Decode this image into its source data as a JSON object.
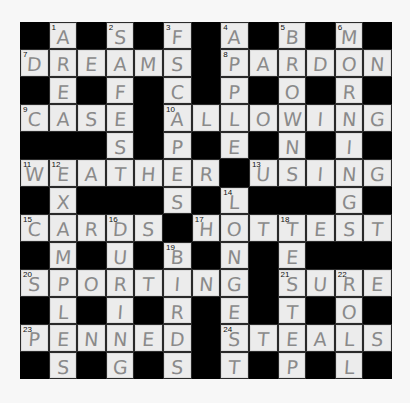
{
  "puzzle": {
    "rows": 13,
    "cols": 13,
    "colors": {
      "background": "#f7f7f7",
      "block": "#000000",
      "cell": "#ececec",
      "pencil": "#8a8a8a",
      "number": "#111111"
    },
    "grid": [
      "#A#S#F#A#B#M#",
      "DREAMS#PARDON",
      "#E#F#C#P#O#R#",
      "CASE#ALLOWING",
      "###S#P#E#N#I#",
      "WEATHER#USING",
      "#X###S#L###G#",
      "CARDS#HOTTEST",
      "#M#U#B#N#E###",
      "SPORTING#SURE",
      "#L#I#R#E#T#O#",
      "PENNED#STEALS",
      "#S#G#S#T#P#L#"
    ],
    "numbers": [
      {
        "r": 0,
        "c": 1,
        "n": "1"
      },
      {
        "r": 0,
        "c": 3,
        "n": "2"
      },
      {
        "r": 0,
        "c": 5,
        "n": "3"
      },
      {
        "r": 0,
        "c": 7,
        "n": "4"
      },
      {
        "r": 0,
        "c": 9,
        "n": "5"
      },
      {
        "r": 0,
        "c": 11,
        "n": "6"
      },
      {
        "r": 1,
        "c": 0,
        "n": "7"
      },
      {
        "r": 1,
        "c": 7,
        "n": "8"
      },
      {
        "r": 3,
        "c": 0,
        "n": "9"
      },
      {
        "r": 3,
        "c": 5,
        "n": "10"
      },
      {
        "r": 5,
        "c": 0,
        "n": "11"
      },
      {
        "r": 5,
        "c": 1,
        "n": "12"
      },
      {
        "r": 5,
        "c": 8,
        "n": "13"
      },
      {
        "r": 6,
        "c": 7,
        "n": "14"
      },
      {
        "r": 7,
        "c": 0,
        "n": "15"
      },
      {
        "r": 7,
        "c": 3,
        "n": "16"
      },
      {
        "r": 7,
        "c": 6,
        "n": "17"
      },
      {
        "r": 7,
        "c": 9,
        "n": "18"
      },
      {
        "r": 8,
        "c": 5,
        "n": "19"
      },
      {
        "r": 9,
        "c": 0,
        "n": "20"
      },
      {
        "r": 9,
        "c": 9,
        "n": "21"
      },
      {
        "r": 9,
        "c": 11,
        "n": "22"
      },
      {
        "r": 11,
        "c": 0,
        "n": "23"
      },
      {
        "r": 11,
        "c": 7,
        "n": "24"
      }
    ],
    "across": [
      {
        "n": "7",
        "answer": "DREAMS"
      },
      {
        "n": "8",
        "answer": "PARDON"
      },
      {
        "n": "9",
        "answer": "CASE"
      },
      {
        "n": "10",
        "answer": "ALLOWING"
      },
      {
        "n": "11",
        "answer": "WEATHER"
      },
      {
        "n": "13",
        "answer": "USING"
      },
      {
        "n": "15",
        "answer": "CARDS"
      },
      {
        "n": "17",
        "answer": "HOTTEST"
      },
      {
        "n": "20",
        "answer": "SPORTING"
      },
      {
        "n": "21",
        "answer": "SURE"
      },
      {
        "n": "23",
        "answer": "PENNED"
      },
      {
        "n": "24",
        "answer": "STEALS"
      }
    ],
    "down": [
      {
        "n": "1",
        "answer": "AREA"
      },
      {
        "n": "2",
        "answer": "SAFES"
      },
      {
        "n": "3",
        "answer": "FSCAPES"
      },
      {
        "n": "4",
        "answer": "APPLE"
      },
      {
        "n": "5",
        "answer": "BROWNS"
      },
      {
        "n": "6",
        "answer": "MORNING"
      },
      {
        "n": "12",
        "answer": "EXAMPLES"
      },
      {
        "n": "14",
        "answer": "LONGEST"
      },
      {
        "n": "16",
        "answer": "DURING"
      },
      {
        "n": "18",
        "answer": "TESTEP"
      },
      {
        "n": "19",
        "answer": "BIRDS"
      },
      {
        "n": "22",
        "answer": "ROLL"
      }
    ]
  }
}
